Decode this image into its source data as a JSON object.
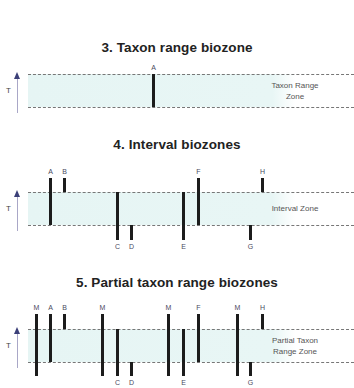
{
  "colors": {
    "band": "#e8f6f5",
    "bar": "#1c1c1c",
    "dash": "#777777",
    "axis": "#3b3f78"
  },
  "axis_label": "T",
  "panels": [
    {
      "title": "3. Taxon range biozone",
      "zone_label_lines": [
        "Taxon Range",
        "Zone"
      ],
      "taxa": [
        {
          "label": "A",
          "x": 153,
          "top": "top",
          "bottom": "bottom"
        }
      ]
    },
    {
      "title": "4. Interval biozones",
      "zone_label_lines": [
        "Interval Zone"
      ],
      "taxa": [
        {
          "label": "A",
          "x": 50,
          "top": "above",
          "bottom": "bottom"
        },
        {
          "label": "B",
          "x": 64,
          "top": "above",
          "bottom": "top"
        },
        {
          "label": "C",
          "x": 117,
          "top": "top",
          "bottom": "below"
        },
        {
          "label": "D",
          "x": 131,
          "top": "bottom",
          "bottom": "below"
        },
        {
          "label": "E",
          "x": 183,
          "top": "top",
          "bottom": "below"
        },
        {
          "label": "F",
          "x": 198,
          "top": "above",
          "bottom": "bottom"
        },
        {
          "label": "G",
          "x": 250,
          "top": "bottom",
          "bottom": "below"
        },
        {
          "label": "H",
          "x": 262,
          "top": "above",
          "bottom": "top"
        }
      ]
    },
    {
      "title": "5. Partial taxon range biozones",
      "zone_label_lines": [
        "Partial Taxon",
        "Range Zone"
      ],
      "taxa": [
        {
          "label": "M",
          "x": 36,
          "top": "above",
          "bottom": "below"
        },
        {
          "label": "A",
          "x": 50,
          "top": "above",
          "bottom": "bottom"
        },
        {
          "label": "B",
          "x": 64,
          "top": "above",
          "bottom": "top"
        },
        {
          "label": "M",
          "x": 102,
          "top": "above",
          "bottom": "below"
        },
        {
          "label": "C",
          "x": 117,
          "top": "top",
          "bottom": "below"
        },
        {
          "label": "D",
          "x": 131,
          "top": "bottom",
          "bottom": "below"
        },
        {
          "label": "M",
          "x": 168,
          "top": "above",
          "bottom": "below"
        },
        {
          "label": "E",
          "x": 183,
          "top": "top",
          "bottom": "below"
        },
        {
          "label": "F",
          "x": 198,
          "top": "above",
          "bottom": "bottom"
        },
        {
          "label": "M",
          "x": 237,
          "top": "above",
          "bottom": "below"
        },
        {
          "label": "G",
          "x": 250,
          "top": "bottom",
          "bottom": "below"
        },
        {
          "label": "H",
          "x": 262,
          "top": "above",
          "bottom": "top"
        }
      ]
    }
  ]
}
